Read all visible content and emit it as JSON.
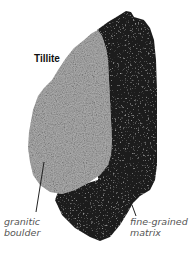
{
  "figure": {
    "title": "Tillite",
    "labels": {
      "boulder": {
        "line1": "granitic",
        "line2": "boulder"
      },
      "matrix": {
        "line1": "fine-grained",
        "line2": "matrix"
      }
    },
    "colors": {
      "background": "#ffffff",
      "matrix": "#1c1c1c",
      "boulder": "#a8a8a8",
      "label_text": "#555555",
      "title_text": "#111111"
    }
  }
}
